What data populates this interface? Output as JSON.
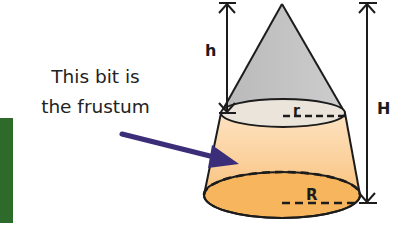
{
  "caption": {
    "line1": "This bit is",
    "line2": "the frustum"
  },
  "labels": {
    "small_height": "h",
    "large_height": "H",
    "small_radius": "r",
    "large_radius": "R"
  },
  "colors": {
    "cone_top": "#c4c4c4",
    "top_ellipse": "#ece4d8",
    "frustum_light": "#fcd9b0",
    "frustum_mid": "#f9bf7d",
    "bottom_ellipse": "#f7b45e",
    "arrow": "#3b2d78",
    "green_block": "#2e6a2a",
    "outline": "#1c1c1c"
  }
}
